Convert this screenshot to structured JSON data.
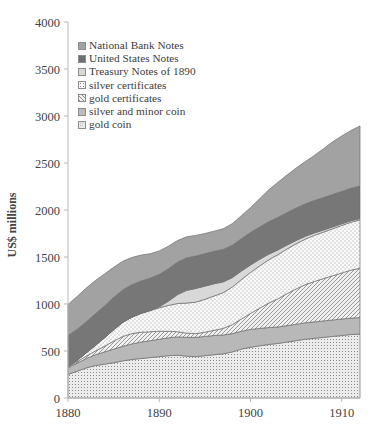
{
  "chart_data": {
    "type": "area",
    "stacked": true,
    "title": "",
    "xlabel": "",
    "ylabel": "US$ millions",
    "xlim": [
      1880,
      1912
    ],
    "ylim": [
      0,
      4000
    ],
    "y_ticks": [
      0,
      500,
      1000,
      1500,
      2000,
      2500,
      3000,
      3500,
      4000
    ],
    "x_ticks": [
      1880,
      1890,
      1900,
      1910
    ],
    "x_tick_labels": [
      "1880",
      "1890",
      "1900",
      "1910"
    ],
    "grid": false,
    "legend_position": "top-left",
    "x": [
      1880,
      1881,
      1882,
      1883,
      1884,
      1885,
      1886,
      1887,
      1888,
      1889,
      1890,
      1891,
      1892,
      1893,
      1894,
      1895,
      1896,
      1897,
      1898,
      1899,
      1900,
      1901,
      1902,
      1903,
      1904,
      1905,
      1906,
      1907,
      1908,
      1909,
      1910,
      1911,
      1912
    ],
    "series": [
      {
        "name": "gold coin",
        "pattern": "fine-grid-dots",
        "color": "#e4e4e4",
        "values": [
          250,
          285,
          320,
          345,
          360,
          375,
          395,
          410,
          420,
          430,
          440,
          450,
          455,
          445,
          440,
          450,
          460,
          470,
          490,
          520,
          540,
          555,
          570,
          580,
          595,
          610,
          625,
          635,
          645,
          655,
          665,
          675,
          680
        ]
      },
      {
        "name": "silver and minor coin",
        "pattern": "solid-light-gray",
        "color": "#b6b6b6",
        "values": [
          70,
          85,
          100,
          115,
          130,
          145,
          155,
          165,
          175,
          180,
          185,
          190,
          195,
          200,
          205,
          205,
          205,
          200,
          195,
          190,
          190,
          185,
          180,
          175,
          175,
          175,
          175,
          175,
          175,
          175,
          175,
          175,
          175
        ]
      },
      {
        "name": "gold certificates",
        "pattern": "diagonal-hatch",
        "color": "#ededed",
        "values": [
          10,
          15,
          25,
          40,
          60,
          85,
          105,
          110,
          105,
          95,
          85,
          70,
          55,
          45,
          40,
          45,
          55,
          70,
          95,
          130,
          170,
          215,
          260,
          300,
          340,
          375,
          405,
          430,
          450,
          470,
          490,
          510,
          525
        ]
      },
      {
        "name": "silver certificates",
        "pattern": "dotted",
        "color": "#f3f3f3",
        "values": [
          5,
          15,
          35,
          60,
          90,
          120,
          150,
          175,
          200,
          225,
          250,
          275,
          300,
          320,
          335,
          350,
          365,
          380,
          400,
          420,
          435,
          450,
          460,
          470,
          475,
          480,
          485,
          490,
          495,
          500,
          505,
          510,
          515
        ]
      },
      {
        "name": "Treasury Notes of 1890",
        "pattern": "solid-pale-gray",
        "color": "#d6d6d6",
        "values": [
          0,
          0,
          0,
          0,
          0,
          0,
          0,
          0,
          0,
          0,
          10,
          45,
          95,
          135,
          145,
          140,
          130,
          115,
          100,
          90,
          80,
          70,
          60,
          50,
          42,
          36,
          30,
          26,
          22,
          20,
          18,
          16,
          14
        ]
      },
      {
        "name": "United States Notes",
        "pattern": "solid-dark-gray",
        "color": "#767676",
        "values": [
          330,
          330,
          330,
          335,
          340,
          345,
          345,
          345,
          345,
          345,
          345,
          345,
          345,
          345,
          345,
          345,
          345,
          345,
          345,
          345,
          345,
          345,
          345,
          345,
          345,
          345,
          345,
          345,
          345,
          345,
          345,
          345,
          345
        ]
      },
      {
        "name": "National Bank Notes",
        "pattern": "solid-medium-gray",
        "color": "#a0a0a0",
        "values": [
          330,
          350,
          360,
          355,
          340,
          320,
          305,
          290,
          275,
          260,
          250,
          240,
          230,
          225,
          220,
          215,
          215,
          220,
          230,
          245,
          265,
          300,
          340,
          375,
          400,
          425,
          450,
          480,
          520,
          560,
          590,
          615,
          640
        ]
      }
    ],
    "legend_entries": [
      "National Bank Notes",
      "United States Notes",
      "Treasury Notes of 1890",
      "silver certificates",
      "gold certificates",
      "silver and minor coin",
      "gold coin"
    ]
  }
}
